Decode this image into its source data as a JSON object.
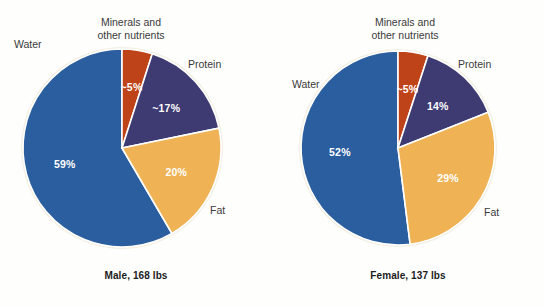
{
  "chart_data": [
    {
      "type": "pie",
      "title": "Male, 168 lbs",
      "id": "male",
      "categories": [
        "Water",
        "Minerals and other nutrients",
        "Protein",
        "Fat"
      ],
      "values": [
        59,
        5,
        17,
        20
      ],
      "labels": [
        "59%",
        "~5%",
        "~17%",
        "20%"
      ],
      "colors": [
        "#2a5e9e",
        "#bf4318",
        "#3e3a72",
        "#efb355"
      ],
      "legend": "none",
      "grid": false
    },
    {
      "type": "pie",
      "title": "Female, 137 lbs",
      "id": "female",
      "categories": [
        "Water",
        "Minerals and other nutrients",
        "Protein",
        "Fat"
      ],
      "values": [
        52,
        5,
        14,
        29
      ],
      "labels": [
        "52%",
        "~5%",
        "14%",
        "29%"
      ],
      "colors": [
        "#2a5e9e",
        "#bf4318",
        "#3e3a72",
        "#efb355"
      ],
      "legend": "none",
      "grid": false
    }
  ],
  "male": {
    "caption": "Male, 168 lbs",
    "labels": {
      "minerals_line1": "Minerals and",
      "minerals_line2": "other nutrients",
      "water": "Water",
      "protein": "Protein",
      "fat": "Fat"
    },
    "slices": {
      "water": "59%",
      "minerals": "~5%",
      "protein": "~17%",
      "fat": "20%"
    }
  },
  "female": {
    "caption": "Female, 137 lbs",
    "labels": {
      "minerals_line1": "Minerals and",
      "minerals_line2": "other nutrients",
      "water": "Water",
      "protein": "Protein",
      "fat": "Fat"
    },
    "slices": {
      "water": "52%",
      "minerals": "~5%",
      "protein": "14%",
      "fat": "29%"
    }
  },
  "colors": {
    "water": "#2a5e9e",
    "minerals": "#bf4318",
    "protein": "#3e3a72",
    "fat": "#efb355",
    "background": "#fefefd",
    "label_text": "#3a3a3a",
    "caption_text": "#1c1c1c"
  }
}
